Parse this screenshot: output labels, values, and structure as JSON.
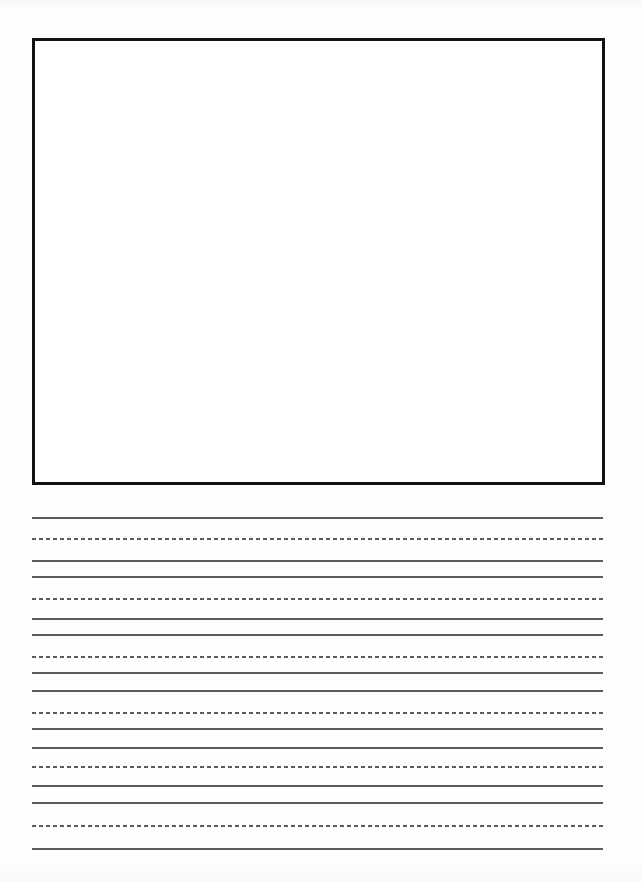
{
  "document": {
    "kind": "handwriting-practice-worksheet",
    "page_width": 642,
    "page_height": 881,
    "background_color": "#fefefe",
    "ink_color": "#5b5b5b",
    "border_color": "#111111",
    "drawing_box": {
      "name": "picture-area",
      "content": "",
      "left": 32,
      "top": 38,
      "width": 573,
      "height": 447,
      "border_width": 3,
      "border_color": "#111111",
      "fill_color": "#ffffff"
    },
    "writing_area": {
      "left": 32,
      "right": 603,
      "line_width": 571,
      "group_count": 6,
      "line_thickness_solid": 2,
      "dash_length": 4,
      "dash_gap": 3,
      "groups": [
        {
          "label": "writing-line-1",
          "top": 517,
          "middle": 538,
          "baseline": 560
        },
        {
          "label": "writing-line-2",
          "top": 576,
          "middle": 598,
          "baseline": 618
        },
        {
          "label": "writing-line-3",
          "top": 634,
          "middle": 656,
          "baseline": 672
        },
        {
          "label": "writing-line-4",
          "top": 690,
          "middle": 712,
          "baseline": 728
        },
        {
          "label": "writing-line-5",
          "top": 747,
          "middle": 766,
          "baseline": 785
        },
        {
          "label": "writing-line-6",
          "top": 802,
          "middle": 825,
          "baseline": 848
        }
      ]
    },
    "text_content": {
      "headers": [],
      "body_text": [],
      "footer": [],
      "note": "No printed text, labels, page numbers, or markings are present on the page."
    }
  }
}
